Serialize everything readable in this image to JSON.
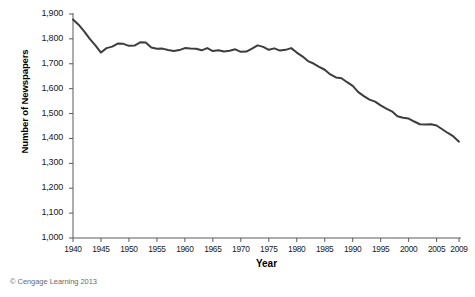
{
  "figure": {
    "credit": "© Cengage Learning 2013",
    "cut_title_fragment": "",
    "line_color": "#3d3d3d",
    "axis_color": "#5a5a5a",
    "background": "#ffffff"
  },
  "chart_data": {
    "type": "line",
    "title": "",
    "xlabel": "Year",
    "ylabel": "Number of Newspapers",
    "xlim": [
      1940,
      2009
    ],
    "ylim": [
      1000,
      1900
    ],
    "grid": false,
    "legend": null,
    "xticks": [
      1940,
      1945,
      1950,
      1955,
      1960,
      1965,
      1970,
      1975,
      1980,
      1985,
      1990,
      1995,
      2000,
      2005,
      2009
    ],
    "xtick_labels": [
      "1940",
      "1945",
      "1950",
      "1955",
      "1960",
      "1965",
      "1970",
      "1975",
      "1980",
      "1985",
      "1990",
      "1995",
      "2000",
      "2005",
      "2009"
    ],
    "yticks": [
      1000,
      1100,
      1200,
      1300,
      1400,
      1500,
      1600,
      1700,
      1800,
      1900
    ],
    "ytick_labels": [
      "1,000",
      "1,100",
      "1,200",
      "1,300",
      "1,400",
      "1,500",
      "1,600",
      "1,700",
      "1,800",
      "1,900"
    ],
    "series": [
      {
        "name": "Number of Newspapers",
        "x": [
          1940,
          1941,
          1942,
          1943,
          1944,
          1945,
          1946,
          1947,
          1948,
          1949,
          1950,
          1951,
          1952,
          1953,
          1954,
          1955,
          1956,
          1957,
          1958,
          1959,
          1960,
          1961,
          1962,
          1963,
          1964,
          1965,
          1966,
          1967,
          1968,
          1969,
          1970,
          1971,
          1972,
          1973,
          1974,
          1975,
          1976,
          1977,
          1978,
          1979,
          1980,
          1981,
          1982,
          1983,
          1984,
          1985,
          1986,
          1987,
          1988,
          1989,
          1990,
          1991,
          1992,
          1993,
          1994,
          1995,
          1996,
          1997,
          1998,
          1999,
          2000,
          2001,
          2002,
          2003,
          2004,
          2005,
          2006,
          2007,
          2008,
          2009
        ],
        "values": [
          1878,
          1857,
          1830,
          1800,
          1774,
          1745,
          1763,
          1769,
          1781,
          1780,
          1772,
          1773,
          1786,
          1785,
          1765,
          1760,
          1761,
          1755,
          1751,
          1755,
          1763,
          1761,
          1760,
          1754,
          1763,
          1751,
          1754,
          1749,
          1752,
          1758,
          1748,
          1749,
          1761,
          1774,
          1768,
          1756,
          1762,
          1753,
          1756,
          1763,
          1745,
          1730,
          1711,
          1701,
          1688,
          1676,
          1657,
          1645,
          1642,
          1626,
          1611,
          1586,
          1570,
          1556,
          1548,
          1533,
          1520,
          1509,
          1489,
          1483,
          1480,
          1468,
          1457,
          1456,
          1457,
          1452,
          1437,
          1422,
          1408,
          1387
        ]
      }
    ]
  }
}
